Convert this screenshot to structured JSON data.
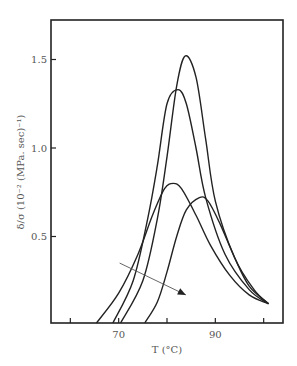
{
  "chart_data": {
    "type": "line",
    "title": "",
    "xlabel": "T (°C)",
    "ylabel": "δ/σ (10⁻² (MPa. sec)⁻¹)",
    "xlim": [
      56,
      104
    ],
    "ylim": [
      0,
      1.72
    ],
    "x_ticks": [
      60,
      70,
      80,
      90,
      100
    ],
    "x_tick_labels": [
      "",
      "70",
      "",
      "90",
      ""
    ],
    "y_ticks": [
      0.5,
      1.0,
      1.5
    ],
    "y_tick_labels": [
      "0.5",
      "1.0",
      "1.5"
    ],
    "grid": false,
    "legend": null,
    "series": [
      {
        "name": "curve-1",
        "x": [
          70.4,
          75,
          78,
          80,
          82,
          83.8,
          86,
          88,
          90,
          94,
          98,
          101
        ],
        "y": [
          0,
          0.25,
          0.6,
          0.95,
          1.35,
          1.52,
          1.4,
          1.05,
          0.7,
          0.38,
          0.2,
          0.12
        ]
      },
      {
        "name": "curve-2",
        "x": [
          68.8,
          73,
          76,
          78,
          80,
          82.3,
          84,
          86,
          88,
          92,
          97,
          101
        ],
        "y": [
          0,
          0.25,
          0.6,
          0.9,
          1.25,
          1.33,
          1.25,
          1.0,
          0.72,
          0.4,
          0.2,
          0.12
        ]
      },
      {
        "name": "curve-3",
        "x": [
          65.4,
          70,
          74,
          77,
          79.5,
          81.3,
          83,
          86,
          89,
          93,
          97,
          101
        ],
        "y": [
          0,
          0.18,
          0.4,
          0.62,
          0.77,
          0.8,
          0.77,
          0.62,
          0.45,
          0.28,
          0.17,
          0.12
        ]
      },
      {
        "name": "curve-4",
        "x": [
          75.4,
          78,
          80,
          82,
          84,
          86.7,
          88.5,
          91,
          94,
          97,
          101
        ],
        "y": [
          0,
          0.13,
          0.3,
          0.5,
          0.65,
          0.72,
          0.7,
          0.57,
          0.38,
          0.22,
          0.12
        ]
      }
    ],
    "annotations": [
      {
        "type": "arrow",
        "from": [
          70.2,
          0.35
        ],
        "to": [
          83.9,
          0.17
        ],
        "label": ""
      }
    ]
  }
}
